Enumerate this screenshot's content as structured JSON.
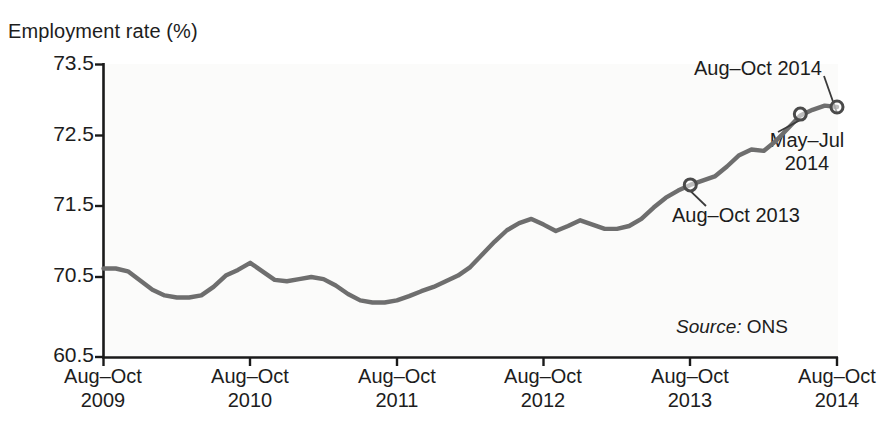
{
  "chart_data": {
    "type": "line",
    "title": "Employment rate (%)",
    "xlabel": "",
    "ylabel": "Employment rate (%)",
    "ylim": [
      69.5,
      73.5
    ],
    "ytick_labels": [
      "73.5",
      "72.5",
      "71.5",
      "70.5",
      "60.5"
    ],
    "ytick_values": [
      73.5,
      72.5,
      71.5,
      70.5,
      69.5
    ],
    "grid": false,
    "legend": "none",
    "source": {
      "label": "Source:",
      "value": "ONS"
    },
    "xtick_labels": [
      {
        "period": "Aug–Oct",
        "year": "2009"
      },
      {
        "period": "Aug–Oct",
        "year": "2010"
      },
      {
        "period": "Aug–Oct",
        "year": "2011"
      },
      {
        "period": "Aug–Oct",
        "year": "2012"
      },
      {
        "period": "Aug–Oct",
        "year": "2013"
      },
      {
        "period": "Aug–Oct",
        "year": "2014"
      }
    ],
    "series": [
      {
        "name": "Employment rate",
        "color": "#6e6e6e",
        "x": [
          0,
          1,
          2,
          3,
          4,
          5,
          6,
          7,
          8,
          9,
          10,
          11,
          12,
          13,
          14,
          15,
          16,
          17,
          18,
          19,
          20,
          21,
          22,
          23,
          24,
          25,
          26,
          27,
          28,
          29,
          30,
          31,
          32,
          33,
          34,
          35,
          36,
          37,
          38,
          39,
          40,
          41,
          42,
          43,
          44,
          45,
          46,
          47,
          48,
          49,
          50,
          51,
          52,
          53,
          54,
          55,
          56,
          57,
          58,
          59,
          60
        ],
        "values": [
          70.62,
          70.62,
          70.58,
          70.45,
          70.32,
          70.24,
          70.21,
          70.21,
          70.24,
          70.36,
          70.52,
          70.6,
          70.7,
          70.58,
          70.46,
          70.44,
          70.47,
          70.5,
          70.47,
          70.38,
          70.26,
          70.17,
          70.14,
          70.14,
          70.17,
          70.23,
          70.3,
          70.36,
          70.44,
          70.52,
          70.64,
          70.82,
          71.0,
          71.16,
          71.26,
          71.32,
          71.24,
          71.15,
          71.22,
          71.3,
          71.24,
          71.18,
          71.18,
          71.22,
          71.32,
          71.48,
          71.62,
          71.72,
          71.8,
          71.86,
          71.92,
          72.06,
          72.22,
          72.3,
          72.28,
          72.42,
          72.6,
          72.78,
          72.86,
          72.92,
          72.9
        ]
      }
    ],
    "markers": [
      {
        "label": "Aug–Oct 2013",
        "x_index": 48,
        "value": 71.8
      },
      {
        "label": "May–Jul 2014",
        "x_index": 57,
        "value": 72.8
      },
      {
        "label": "Aug–Oct 2014",
        "x_index": 60,
        "value": 72.9
      }
    ],
    "annotations": [
      {
        "id": "ann-aug-oct-2014",
        "text": "Aug–Oct 2014"
      },
      {
        "id": "ann-may-jul-2014",
        "line1": "May–Jul",
        "line2": "2014"
      },
      {
        "id": "ann-aug-oct-2013",
        "text": "Aug–Oct 2013"
      }
    ]
  }
}
